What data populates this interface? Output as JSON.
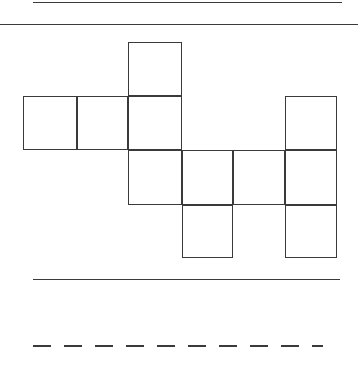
{
  "page": {
    "width": 358,
    "height": 370,
    "background_color": "#ffffff",
    "stroke_color": "#3a3a3a"
  },
  "rules": [
    {
      "name": "top-rule",
      "style": "solid",
      "x": 33,
      "y": 2,
      "length": 309,
      "thickness": 1.4
    },
    {
      "name": "upper-divider-rule",
      "style": "solid",
      "x": 0,
      "y": 24,
      "length": 358,
      "thickness": 1.4
    },
    {
      "name": "lower-divider-rule",
      "style": "solid",
      "x": 33,
      "y": 279,
      "length": 307,
      "thickness": 1.4
    },
    {
      "name": "bottom-dashed-rule",
      "style": "dashed",
      "x": 33,
      "y": 345,
      "length": 290,
      "thickness": 1.6,
      "dash_length": 18,
      "gap_length": 13
    }
  ],
  "figure": {
    "name": "cube-net-polyomino",
    "square_size": 53,
    "column_x": [
      23,
      77,
      128,
      182,
      233,
      285,
      337
    ],
    "row_y": [
      42,
      96,
      150,
      205,
      258
    ],
    "square_count": 9,
    "squares": [
      {
        "id": "square-r0c2",
        "row": 0,
        "col": 2,
        "x": 128,
        "y": 42,
        "width": 54,
        "height": 54
      },
      {
        "id": "square-r1c0",
        "row": 1,
        "col": 0,
        "x": 23,
        "y": 96,
        "width": 54,
        "height": 54
      },
      {
        "id": "square-r1c1",
        "row": 1,
        "col": 1,
        "x": 77,
        "y": 96,
        "width": 51,
        "height": 54
      },
      {
        "id": "square-r1c2",
        "row": 1,
        "col": 2,
        "x": 128,
        "y": 96,
        "width": 54,
        "height": 54
      },
      {
        "id": "square-r1c5",
        "row": 1,
        "col": 5,
        "x": 285,
        "y": 96,
        "width": 52,
        "height": 54
      },
      {
        "id": "square-r2c2",
        "row": 2,
        "col": 2,
        "x": 128,
        "y": 150,
        "width": 54,
        "height": 55
      },
      {
        "id": "square-r2c3",
        "row": 2,
        "col": 3,
        "x": 182,
        "y": 150,
        "width": 51,
        "height": 55
      },
      {
        "id": "square-r2c4",
        "row": 2,
        "col": 4,
        "x": 233,
        "y": 150,
        "width": 52,
        "height": 55
      },
      {
        "id": "square-r2c5",
        "row": 2,
        "col": 5,
        "x": 285,
        "y": 150,
        "width": 52,
        "height": 55
      },
      {
        "id": "square-r3c3",
        "row": 3,
        "col": 3,
        "x": 182,
        "y": 205,
        "width": 51,
        "height": 53
      },
      {
        "id": "square-r3c5",
        "row": 3,
        "col": 5,
        "x": 285,
        "y": 205,
        "width": 52,
        "height": 53
      }
    ]
  }
}
